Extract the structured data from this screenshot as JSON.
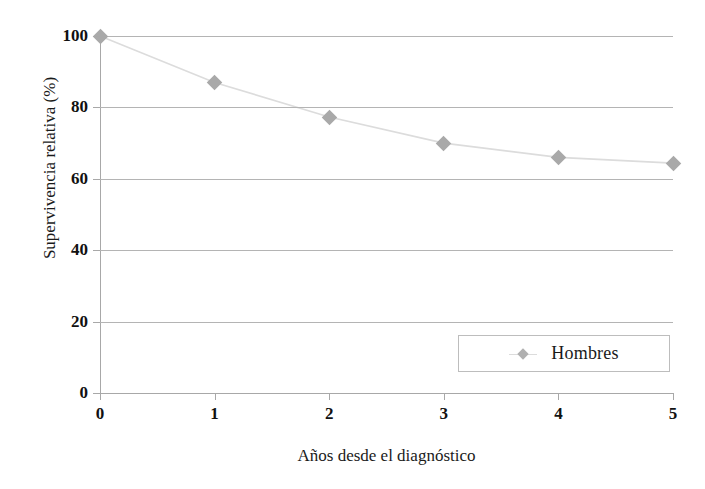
{
  "chart_data": {
    "type": "line",
    "title": "",
    "xlabel": "Años desde el diagnóstico",
    "ylabel": "Supervivencia relativa (%)",
    "x": [
      0,
      1,
      2,
      3,
      4,
      5
    ],
    "xtick_labels": [
      "0",
      "1",
      "2",
      "3",
      "4",
      "5"
    ],
    "ytick_labels": [
      "0",
      "20",
      "40",
      "60",
      "80",
      "100"
    ],
    "ytick_values": [
      0,
      20,
      40,
      60,
      80,
      100
    ],
    "xlim": [
      0,
      5
    ],
    "ylim": [
      0,
      100
    ],
    "grid": "horizontal",
    "legend_position": "lower-right",
    "series": [
      {
        "name": "Hombres",
        "marker": "diamond",
        "marker_color": "#a9a9a9",
        "line_color": "#dcdcdc",
        "values": [
          100,
          87,
          77.3,
          70,
          66,
          64.4
        ]
      }
    ]
  },
  "legend": {
    "entries": [
      {
        "label": "Hombres",
        "marker_icon": "diamond-marker-icon"
      }
    ]
  },
  "colors": {
    "marker": "#a9a9a9",
    "line": "#dcdcdc",
    "gridline": "#b4b4b4",
    "axis": "#a8a8a8",
    "text": "#1a1a1a",
    "background": "#ffffff"
  }
}
